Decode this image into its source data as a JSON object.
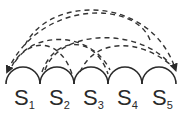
{
  "diagram": {
    "cells": [
      {
        "name": "S",
        "sub": "1"
      },
      {
        "name": "S",
        "sub": "2"
      },
      {
        "name": "S",
        "sub": "3"
      },
      {
        "name": "S",
        "sub": "4"
      },
      {
        "name": "S",
        "sub": "5"
      }
    ],
    "line_color": "#2a2a2a",
    "dashed_links": [
      {
        "from": "S5",
        "to": "S1",
        "arrow": "S1"
      },
      {
        "from": "S1",
        "to": "S5",
        "arrow": "S5"
      },
      {
        "from": "S1",
        "to": "S3"
      },
      {
        "from": "S2",
        "to": "S4"
      },
      {
        "from": "S3",
        "to": "S5"
      },
      {
        "from": "S1",
        "to": "S4"
      },
      {
        "from": "S2",
        "to": "S5"
      }
    ]
  }
}
